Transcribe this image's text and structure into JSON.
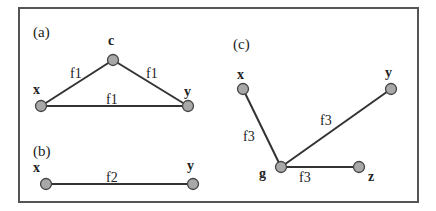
{
  "panels": [
    {
      "id": "a",
      "label": "(a)",
      "nodes": [
        {
          "id": "c",
          "label": "c"
        },
        {
          "id": "x",
          "label": "x"
        },
        {
          "id": "y",
          "label": "y"
        }
      ],
      "edges": [
        {
          "from": "x",
          "to": "c",
          "label": "f1"
        },
        {
          "from": "c",
          "to": "y",
          "label": "f1"
        },
        {
          "from": "x",
          "to": "y",
          "label": "f1"
        }
      ]
    },
    {
      "id": "b",
      "label": "(b)",
      "nodes": [
        {
          "id": "x",
          "label": "x"
        },
        {
          "id": "y",
          "label": "y"
        }
      ],
      "edges": [
        {
          "from": "x",
          "to": "y",
          "label": "f2"
        }
      ]
    },
    {
      "id": "c",
      "label": "(c)",
      "nodes": [
        {
          "id": "x",
          "label": "x"
        },
        {
          "id": "y",
          "label": "y"
        },
        {
          "id": "g",
          "label": "g"
        },
        {
          "id": "z",
          "label": "z"
        }
      ],
      "edges": [
        {
          "from": "x",
          "to": "g",
          "label": "f3"
        },
        {
          "from": "g",
          "to": "y",
          "label": "f3"
        },
        {
          "from": "g",
          "to": "z",
          "label": "f3"
        }
      ]
    }
  ],
  "colors": {
    "node_fill": "#a8a8a8",
    "edge": "#333333",
    "frame": "#555555"
  }
}
